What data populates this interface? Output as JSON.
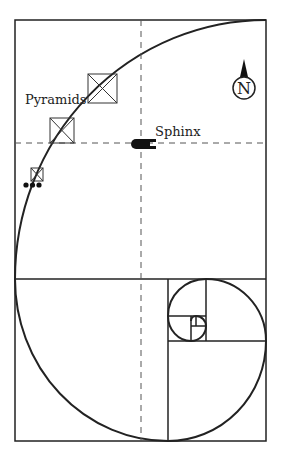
{
  "diagram": {
    "labels": {
      "pyramids": "Pyramids",
      "sphinx": "Sphinx",
      "north": "N"
    },
    "icons": [
      "north-arrow-icon",
      "pyramid-icon",
      "sphinx-icon",
      "dots-icon"
    ],
    "colors": {
      "stroke": "#222222",
      "background": "#ffffff",
      "dashed": "#555555"
    }
  }
}
